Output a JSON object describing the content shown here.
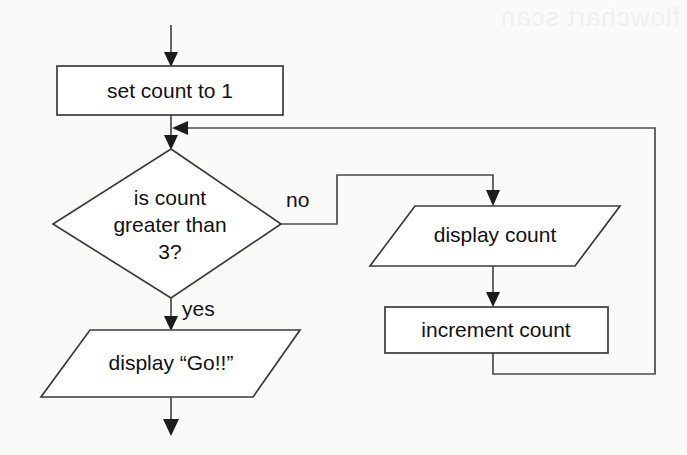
{
  "diagram": {
    "type": "flowchart",
    "background_color": "#fafaf8",
    "shape_fill_color": "#ffffff",
    "shape_stroke_color": "#3b3b3b",
    "connector_color": "#4a4a4a",
    "text_color": "#111111",
    "bleed_artifact": "flowchart scan"
  },
  "nodes": {
    "set_count": {
      "label": "set count to 1",
      "shape": "process-rectangle"
    },
    "decision": {
      "label_line1": "is count",
      "label_line2": "greater than",
      "label_line3": "3?",
      "shape": "decision-diamond"
    },
    "display_go": {
      "label": "display “Go!!”",
      "shape": "io-parallelogram"
    },
    "display_count": {
      "label": "display count",
      "shape": "io-parallelogram"
    },
    "increment_count": {
      "label": "increment count",
      "shape": "process-rectangle"
    }
  },
  "edges": {
    "entry": {
      "label": ""
    },
    "set_to_decision": {
      "label": ""
    },
    "yes_branch": {
      "label": "yes"
    },
    "no_branch": {
      "label": "no"
    },
    "display_to_increment": {
      "label": ""
    },
    "loop_back": {
      "label": ""
    },
    "exit": {
      "label": ""
    }
  }
}
